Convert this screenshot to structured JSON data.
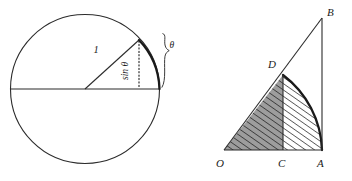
{
  "figure": {
    "panels": [
      {
        "id": "left-panel",
        "name": "unit-circle-sine-diagram",
        "labels": {
          "radius": "1",
          "opposite": "sin θ",
          "angle": "θ"
        },
        "geometry": {
          "center": [
            85,
            89
          ],
          "radius": 75,
          "angle_point": [
            139,
            40
          ],
          "diameter_y": 89
        }
      },
      {
        "id": "right-panel",
        "name": "triangle-sector-comparison-diagram",
        "labels": {
          "origin": "O",
          "foot": "C",
          "base_right": "A",
          "apex": "B",
          "arc_point": "D"
        },
        "geometry": {
          "O": [
            224,
            150
          ],
          "C": [
            283,
            150
          ],
          "A": [
            322,
            150
          ],
          "B": [
            322,
            18
          ],
          "D": [
            283,
            75
          ]
        },
        "regions": [
          {
            "name": "triangle-OCD-shaded",
            "fill": "#9d9d9d",
            "hatched": true
          },
          {
            "name": "sector-segment-CDA-hatched",
            "fill": "#ffffff",
            "hatched": true
          }
        ]
      }
    ],
    "colors": {
      "ink": "#2b2b2b",
      "ink_dark": "#1a1a1a",
      "shade_gray": "#9d9d9d",
      "hatch": "#1a1a1a",
      "background": "#ffffff"
    }
  }
}
